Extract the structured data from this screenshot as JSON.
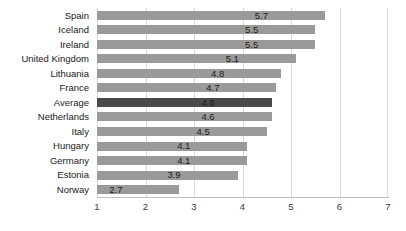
{
  "chart_data": {
    "type": "bar",
    "orientation": "horizontal",
    "title": "",
    "xlabel": "",
    "ylabel": "",
    "xlim": [
      1,
      7
    ],
    "xticks": [
      "1",
      "2",
      "3",
      "4",
      "5",
      "6",
      "7"
    ],
    "grid": true,
    "legend": "none",
    "highlight_category": "Average",
    "colors": {
      "bar": "#9a9a9a",
      "bar_highlight": "#4a4a4a",
      "gridline": "#d9d9d9",
      "axis": "#bfbfbf",
      "text": "#1a1a1a"
    },
    "categories": [
      "Spain",
      "Iceland",
      "Ireland",
      "United Kingdom",
      "Lithuania",
      "France",
      "Average",
      "Netherlands",
      "Italy",
      "Hungary",
      "Germany",
      "Estonia",
      "Norway"
    ],
    "values": [
      5.7,
      5.5,
      5.5,
      5.1,
      4.8,
      4.7,
      4.6,
      4.6,
      4.5,
      4.1,
      4.1,
      3.9,
      2.7
    ],
    "value_labels": [
      "5.7",
      "5.5",
      "5.5",
      "5.1",
      "4.8",
      "4.7",
      "4.6",
      "4.6",
      "4.5",
      "4.1",
      "4.1",
      "3.9",
      "2.7"
    ]
  }
}
